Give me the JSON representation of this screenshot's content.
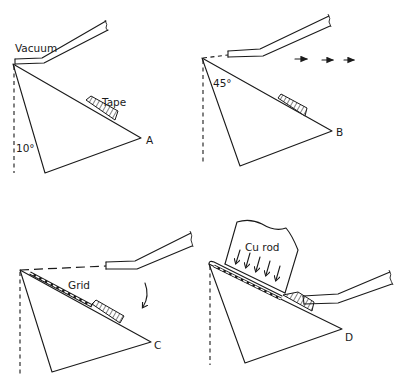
{
  "figure": {
    "panels": [
      {
        "id": "A",
        "vertex_label": "A",
        "labels": {
          "vacuum": "Vacuum",
          "tape": "Tape",
          "angle": "10°"
        }
      },
      {
        "id": "B",
        "vertex_label": "B",
        "labels": {
          "angle": "45°"
        },
        "motion": "arrows-right"
      },
      {
        "id": "C",
        "vertex_label": "C",
        "labels": {
          "grid": "Grid"
        },
        "motion": "curved-arrow-down"
      },
      {
        "id": "D",
        "vertex_label": "D",
        "labels": {
          "rod": "Cu rod"
        },
        "motion": "arrows-down"
      }
    ],
    "colors": {
      "ink": "#1a1a1a",
      "paper": "#ffffff"
    }
  }
}
